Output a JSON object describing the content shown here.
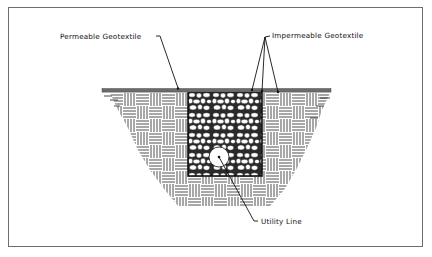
{
  "diagram": {
    "labels": {
      "permeable": "Permeable Geotextile",
      "impermeable": "Impermeable Geotextile",
      "utility": "Utility Line"
    },
    "components": [
      {
        "id": "ground-surface",
        "type": "thick gray line"
      },
      {
        "id": "native-soil",
        "type": "basket-weave hatch"
      },
      {
        "id": "stone-backfill",
        "type": "aggregate fill"
      },
      {
        "id": "utility-pipe",
        "type": "circle"
      }
    ],
    "colors": {
      "ink": "#1a1a1a",
      "ground": "#6b6b6b",
      "frame": "#6e6e6e",
      "background": "#ffffff"
    }
  }
}
